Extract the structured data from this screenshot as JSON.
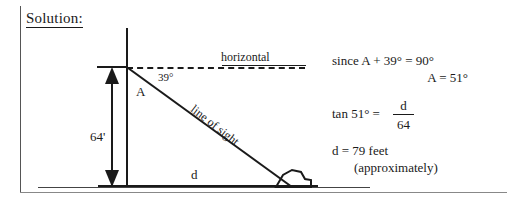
{
  "document": {
    "heading": "Solution:"
  },
  "diagram": {
    "name": "right-triangle-angle-of-depression",
    "labels": {
      "horizontal": "horizontal",
      "angle_of_depression": "39°",
      "vertex_angle": "A",
      "height": "64'",
      "base": "d",
      "hypotenuse": "line of sight"
    },
    "stroke_color": "#1a1a1a",
    "rock": "boulder-shape"
  },
  "work": {
    "line1": "since A + 39° = 90°",
    "line2": "A = 51°",
    "line3_lhs": "tan 51°  =",
    "fraction_numerator": "d",
    "fraction_denominator": "64",
    "line4": "d  =  79  feet",
    "line5": "(approximately)"
  }
}
